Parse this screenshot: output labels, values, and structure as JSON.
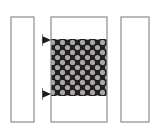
{
  "figure": {
    "caption": "",
    "background_color": "#ffffff",
    "canvas": {
      "width": 162,
      "height": 138
    }
  },
  "style": {
    "outline_color": "#8c8c8c",
    "outline_color_dark": "#6e6e6e",
    "outline_width": 1.2,
    "fill_white": "#ffffff",
    "pattern_background": "#231f20",
    "pattern_dot_color": "#a8a8a8",
    "arrow_color": "#1a1a1a"
  },
  "elements": {
    "left_bar": {
      "name": "left vertical bar",
      "label": "",
      "fill": "none",
      "x": 11,
      "y": 17,
      "width": 23,
      "height": 105
    },
    "center_bar": {
      "name": "center vertical bar",
      "label": "",
      "fill": "none",
      "x": 51,
      "y": 17,
      "width": 56,
      "height": 105
    },
    "right_bar": {
      "name": "right vertical bar",
      "label": "",
      "fill": "none",
      "x": 121,
      "y": 17,
      "width": 28,
      "height": 105
    },
    "patterned_region": {
      "name": "dotted patterned fill region",
      "label": "",
      "x": 51,
      "y": 39,
      "width": 56,
      "height": 57,
      "pattern": {
        "type": "staggered-circles",
        "pitch_x": 10,
        "pitch_y": 10,
        "dot_radius": 2.6,
        "rows": 6,
        "columns": 6,
        "stagger": "alternate-half-pitch"
      }
    }
  },
  "markers": [
    {
      "name": "upper boundary arrow",
      "label": "",
      "tip_x": 51,
      "tip_y": 40,
      "direction": "right",
      "size": 7
    },
    {
      "name": "lower boundary arrow",
      "label": "",
      "tip_x": 51,
      "tip_y": 94,
      "direction": "right",
      "size": 7
    }
  ],
  "annotations": {
    "labels": [],
    "dimension_text": []
  }
}
